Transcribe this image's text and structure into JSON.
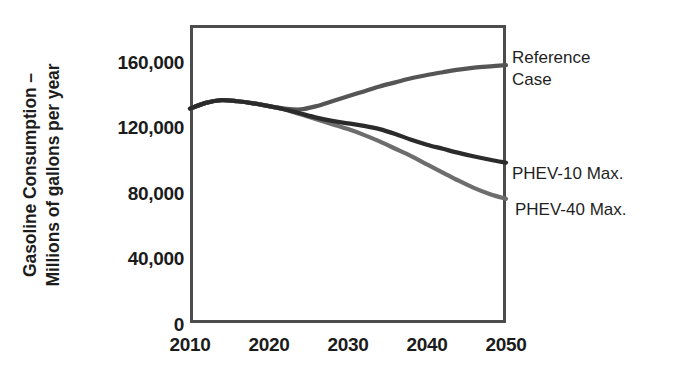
{
  "chart_data": {
    "type": "line",
    "title": "",
    "xlabel": "",
    "ylabel": "Gasoline Consumption – Millions of gallons per year",
    "ylabel_lines": [
      "Gasoline Consumption –",
      "Millions of gallons per year"
    ],
    "xlim": [
      2010,
      2050
    ],
    "ylim": [
      0,
      175000
    ],
    "grid": false,
    "legend_position": "right-of-axes-inline-annotations",
    "xticks": [
      2010,
      2020,
      2030,
      2040,
      2050
    ],
    "xtick_labels": [
      "2010",
      "2020",
      "2030",
      "2040",
      "2050"
    ],
    "yticks": [
      0,
      40000,
      80000,
      120000,
      160000
    ],
    "ytick_labels": [
      "0",
      "40,000",
      "80,000",
      "120,000",
      "160,000"
    ],
    "x": [
      2010,
      2012,
      2014,
      2016,
      2018,
      2020,
      2022,
      2024,
      2026,
      2028,
      2030,
      2032,
      2034,
      2036,
      2038,
      2040,
      2042,
      2044,
      2046,
      2048,
      2050
    ],
    "series": [
      {
        "name": "Reference Case",
        "color": "#555555",
        "values": [
          132000,
          135500,
          137200,
          136500,
          135200,
          133500,
          132000,
          131500,
          133500,
          136500,
          139500,
          142500,
          145500,
          148000,
          150500,
          152500,
          154200,
          155800,
          157000,
          157800,
          158500
        ]
      },
      {
        "name": "PHEV-10 Max.",
        "color": "#2b2b2b",
        "values": [
          132000,
          135500,
          137200,
          136500,
          135200,
          133500,
          131500,
          129000,
          126500,
          124500,
          123000,
          121500,
          119500,
          116500,
          113000,
          110000,
          107500,
          105000,
          102800,
          100800,
          99000
        ]
      },
      {
        "name": "PHEV-40 Max.",
        "color": "#6d6d6d",
        "values": [
          132000,
          135500,
          137200,
          136500,
          135200,
          133500,
          131500,
          128500,
          125500,
          122500,
          119500,
          116000,
          112000,
          107500,
          103000,
          98000,
          93000,
          88000,
          83500,
          79800,
          77000
        ]
      }
    ],
    "annotations": [
      {
        "name": "reference-case",
        "lines": [
          "Reference",
          "Case"
        ],
        "x_px": 512,
        "y_px": 47
      },
      {
        "name": "phev-10-max",
        "lines": [
          "PHEV-10 Max."
        ],
        "x_px": 512,
        "y_px": 163
      },
      {
        "name": "phev-40-max",
        "lines": [
          "PHEV-40 Max."
        ],
        "x_px": 515,
        "y_px": 199
      }
    ],
    "colors": {
      "axis": "#4c4c4c",
      "text": "#1b1b1b",
      "background": "#ffffff"
    }
  }
}
